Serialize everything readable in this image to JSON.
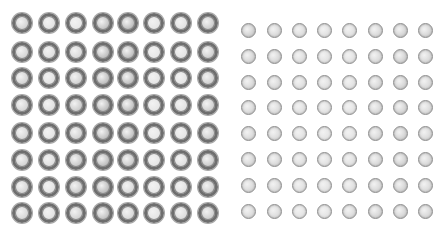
{
  "left_array": {
    "rows": 8,
    "cols": 8,
    "x_centers": [
      22,
      49,
      76,
      103,
      128,
      154,
      181,
      208
    ],
    "y_centers": [
      23,
      52,
      78,
      105,
      133,
      160,
      187,
      213
    ],
    "ring_color": "#6e6e6e",
    "fill_colors": [
      [
        "#cfcfcf",
        "#e2e2e2",
        "#e6e6e6",
        "#bdbdbd",
        "#b8b8b8",
        "#e4e4e4",
        "#e0e0e0",
        "#c8c8c8"
      ],
      [
        "#d2d2d2",
        "#dedede",
        "#d6d6d6",
        "#b7b7b7",
        "#b9b9b9",
        "#e6e6e6",
        "#e2e2e2",
        "#cbcbcb"
      ],
      [
        "#d0d0d0",
        "#e1e1e1",
        "#cfcfcf",
        "#b8b8b8",
        "#bababa",
        "#e3e3e3",
        "#e3e3e3",
        "#cdcdcd"
      ],
      [
        "#d1d1d1",
        "#dfdfdf",
        "#c6c6c6",
        "#b6b6b6",
        "#bcbcbc",
        "#e4e4e4",
        "#e1e1e1",
        "#cdcdcd"
      ],
      [
        "#d3d3d3",
        "#e3e3e3",
        "#cecece",
        "#b8b8b8",
        "#bcbcbc",
        "#e6e6e6",
        "#e3e3e3",
        "#cbcbcb"
      ],
      [
        "#d0d0d0",
        "#dcdcdc",
        "#c4c4c4",
        "#b7b7b7",
        "#c5c5c5",
        "#e4e4e4",
        "#dedede",
        "#c6c6c6"
      ],
      [
        "#d2d2d2",
        "#e2e2e2",
        "#c8c8c8",
        "#b6b6b6",
        "#d8d8d8",
        "#e6e6e6",
        "#e0e0e0",
        "#cbcbcb"
      ],
      [
        "#d4d4d4",
        "#e2e2e2",
        "#cfcfcf",
        "#bcbcbc",
        "#d6d6d6",
        "#e3e3e3",
        "#dadada",
        "#cbcbcb"
      ]
    ]
  },
  "right_array": {
    "rows": 8,
    "cols": 8,
    "x_centers": [
      248,
      274,
      299,
      324,
      349,
      375,
      400,
      425
    ],
    "y_centers": [
      30,
      56,
      82,
      107,
      133,
      159,
      185,
      211
    ],
    "ring_color": "#8c8c8c",
    "fill_colors": [
      [
        "#cdcdcd",
        "#d6d6d6",
        "#dadada",
        "#dedede",
        "#dedede",
        "#d6d6d6",
        "#d0d0d0",
        "#d2d2d2"
      ],
      [
        "#d2d2d2",
        "#d3d3d3",
        "#dcdcdc",
        "#dfdfdf",
        "#e0e0e0",
        "#d6d6d6",
        "#cecece",
        "#d4d4d4"
      ],
      [
        "#d4d4d4",
        "#d6d6d6",
        "#dcdcdc",
        "#dedede",
        "#e0e0e0",
        "#d4d4d4",
        "#d0d0d0",
        "#d6d6d6"
      ],
      [
        "#d6d6d6",
        "#d8d8d8",
        "#dedede",
        "#e0e0e0",
        "#e2e2e2",
        "#d5d5d5",
        "#d0d0d0",
        "#d7d7d7"
      ],
      [
        "#d6d6d6",
        "#d8d8d8",
        "#e0e0e0",
        "#e2e2e2",
        "#e2e2e2",
        "#d5d5d5",
        "#cfcfcf",
        "#d6d6d6"
      ],
      [
        "#d4d4d4",
        "#d6d6d6",
        "#dcdcdc",
        "#dfdfdf",
        "#dedede",
        "#d4d4d4",
        "#cecece",
        "#d4d4d4"
      ],
      [
        "#d6d6d6",
        "#d8d8d8",
        "#dedede",
        "#e0e0e0",
        "#dddddd",
        "#d4d4d4",
        "#d0d0d0",
        "#d6d6d6"
      ],
      [
        "#d8d8d8",
        "#dadada",
        "#e2e2e2",
        "#e2e2e2",
        "#d8d8d8",
        "#d2d2d2",
        "#d2d2d2",
        "#d4d4d4"
      ]
    ]
  }
}
